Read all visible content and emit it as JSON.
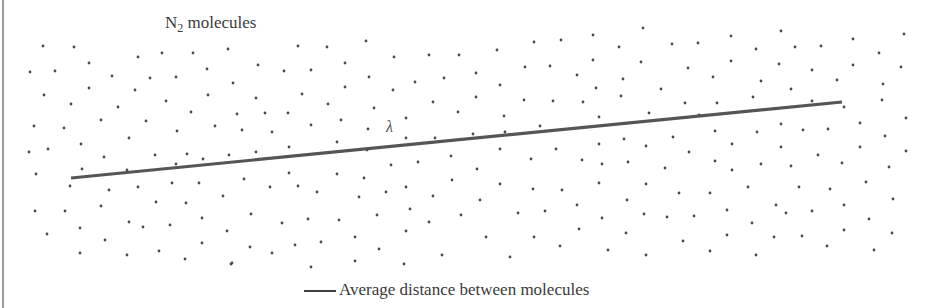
{
  "diagram": {
    "title": {
      "prefix": "N",
      "subscript": "2",
      "suffix": " molecules"
    },
    "path_symbol": "λ",
    "caption": "Average distance between molecules",
    "colors": {
      "dot": "#4a4a4a",
      "path_line": "#555555",
      "text": "#3a3a3a",
      "border": "#9a9a9a",
      "background": "#ffffff"
    },
    "path_line": {
      "x1": 71,
      "y1": 178,
      "x2": 842,
      "y2": 102,
      "stroke_width": 3.2
    },
    "dot_radius": 1.4,
    "molecules": [
      [
        43,
        46
      ],
      [
        74,
        47
      ],
      [
        89,
        63
      ],
      [
        138,
        57
      ],
      [
        162,
        53
      ],
      [
        193,
        53
      ],
      [
        228,
        49
      ],
      [
        30,
        72
      ],
      [
        55,
        71
      ],
      [
        112,
        76
      ],
      [
        150,
        78
      ],
      [
        176,
        77
      ],
      [
        207,
        69
      ],
      [
        233,
        83
      ],
      [
        44,
        95
      ],
      [
        89,
        88
      ],
      [
        135,
        90
      ],
      [
        71,
        104
      ],
      [
        166,
        101
      ],
      [
        208,
        95
      ],
      [
        118,
        107
      ],
      [
        191,
        112
      ],
      [
        237,
        114
      ],
      [
        34,
        126
      ],
      [
        64,
        128
      ],
      [
        101,
        120
      ],
      [
        146,
        121
      ],
      [
        177,
        131
      ],
      [
        215,
        126
      ],
      [
        129,
        138
      ],
      [
        81,
        144
      ],
      [
        48,
        149
      ],
      [
        29,
        152
      ],
      [
        104,
        157
      ],
      [
        155,
        155
      ],
      [
        187,
        154
      ],
      [
        203,
        159
      ],
      [
        229,
        155
      ],
      [
        36,
        174
      ],
      [
        82,
        169
      ],
      [
        127,
        170
      ],
      [
        176,
        164
      ],
      [
        70,
        186
      ],
      [
        109,
        190
      ],
      [
        138,
        187
      ],
      [
        172,
        183
      ],
      [
        199,
        183
      ],
      [
        223,
        196
      ],
      [
        35,
        211
      ],
      [
        65,
        211
      ],
      [
        101,
        206
      ],
      [
        156,
        202
      ],
      [
        186,
        203
      ],
      [
        129,
        222
      ],
      [
        143,
        227
      ],
      [
        170,
        225
      ],
      [
        202,
        218
      ],
      [
        80,
        228
      ],
      [
        227,
        231
      ],
      [
        47,
        234
      ],
      [
        105,
        240
      ],
      [
        202,
        243
      ],
      [
        80,
        253
      ],
      [
        127,
        255
      ],
      [
        159,
        251
      ],
      [
        185,
        259
      ],
      [
        231,
        264
      ],
      [
        298,
        46
      ],
      [
        327,
        47
      ],
      [
        366,
        41
      ],
      [
        258,
        65
      ],
      [
        345,
        63
      ],
      [
        394,
        57
      ],
      [
        429,
        55
      ],
      [
        459,
        55
      ],
      [
        284,
        71
      ],
      [
        311,
        70
      ],
      [
        369,
        77
      ],
      [
        415,
        82
      ],
      [
        444,
        78
      ],
      [
        256,
        98
      ],
      [
        302,
        94
      ],
      [
        345,
        87
      ],
      [
        393,
        90
      ],
      [
        328,
        104
      ],
      [
        374,
        108
      ],
      [
        433,
        102
      ],
      [
        265,
        113
      ],
      [
        288,
        113
      ],
      [
        341,
        120
      ],
      [
        406,
        118
      ],
      [
        458,
        112
      ],
      [
        242,
        130
      ],
      [
        272,
        132
      ],
      [
        311,
        125
      ],
      [
        368,
        129
      ],
      [
        406,
        138
      ],
      [
        435,
        138
      ],
      [
        289,
        147
      ],
      [
        337,
        142
      ],
      [
        256,
        152
      ],
      [
        367,
        150
      ],
      [
        451,
        156
      ],
      [
        391,
        165
      ],
      [
        418,
        162
      ],
      [
        244,
        179
      ],
      [
        289,
        173
      ],
      [
        337,
        174
      ],
      [
        364,
        178
      ],
      [
        452,
        180
      ],
      [
        270,
        187
      ],
      [
        298,
        186
      ],
      [
        317,
        192
      ],
      [
        359,
        197
      ],
      [
        386,
        192
      ],
      [
        406,
        187
      ],
      [
        433,
        196
      ],
      [
        251,
        214
      ],
      [
        282,
        223
      ],
      [
        308,
        219
      ],
      [
        339,
        220
      ],
      [
        377,
        215
      ],
      [
        410,
        209
      ],
      [
        429,
        222
      ],
      [
        461,
        215
      ],
      [
        406,
        231
      ],
      [
        355,
        237
      ],
      [
        250,
        247
      ],
      [
        272,
        253
      ],
      [
        295,
        245
      ],
      [
        321,
        242
      ],
      [
        379,
        249
      ],
      [
        442,
        255
      ],
      [
        232,
        263
      ],
      [
        311,
        267
      ],
      [
        355,
        261
      ],
      [
        404,
        264
      ],
      [
        643,
        28
      ],
      [
        593,
        35
      ],
      [
        497,
        50
      ],
      [
        534,
        42
      ],
      [
        561,
        40
      ],
      [
        619,
        47
      ],
      [
        672,
        44
      ],
      [
        698,
        43
      ],
      [
        476,
        73
      ],
      [
        525,
        67
      ],
      [
        550,
        66
      ],
      [
        593,
        60
      ],
      [
        641,
        62
      ],
      [
        688,
        68
      ],
      [
        577,
        75
      ],
      [
        500,
        85
      ],
      [
        623,
        79
      ],
      [
        476,
        97
      ],
      [
        524,
        100
      ],
      [
        553,
        101
      ],
      [
        583,
        102
      ],
      [
        596,
        88
      ],
      [
        621,
        96
      ],
      [
        661,
        89
      ],
      [
        685,
        103
      ],
      [
        504,
        116
      ],
      [
        599,
        117
      ],
      [
        649,
        113
      ],
      [
        473,
        134
      ],
      [
        505,
        132
      ],
      [
        540,
        126
      ],
      [
        500,
        149
      ],
      [
        556,
        149
      ],
      [
        599,
        144
      ],
      [
        624,
        139
      ],
      [
        646,
        146
      ],
      [
        673,
        137
      ],
      [
        689,
        152
      ],
      [
        531,
        159
      ],
      [
        582,
        160
      ],
      [
        602,
        164
      ],
      [
        628,
        162
      ],
      [
        665,
        168
      ],
      [
        477,
        169
      ],
      [
        500,
        184
      ],
      [
        533,
        189
      ],
      [
        562,
        190
      ],
      [
        599,
        183
      ],
      [
        646,
        184
      ],
      [
        679,
        193
      ],
      [
        480,
        200
      ],
      [
        577,
        205
      ],
      [
        627,
        200
      ],
      [
        518,
        213
      ],
      [
        545,
        211
      ],
      [
        602,
        218
      ],
      [
        644,
        214
      ],
      [
        667,
        217
      ],
      [
        694,
        216
      ],
      [
        486,
        237
      ],
      [
        534,
        237
      ],
      [
        579,
        229
      ],
      [
        626,
        233
      ],
      [
        683,
        241
      ],
      [
        560,
        246
      ],
      [
        608,
        250
      ],
      [
        510,
        257
      ],
      [
        646,
        255
      ],
      [
        731,
        36
      ],
      [
        781,
        31
      ],
      [
        756,
        49
      ],
      [
        795,
        47
      ],
      [
        821,
        46
      ],
      [
        853,
        39
      ],
      [
        879,
        53
      ],
      [
        904,
        34
      ],
      [
        731,
        61
      ],
      [
        779,
        64
      ],
      [
        812,
        70
      ],
      [
        853,
        65
      ],
      [
        901,
        67
      ],
      [
        713,
        77
      ],
      [
        761,
        81
      ],
      [
        791,
        89
      ],
      [
        837,
        80
      ],
      [
        883,
        84
      ],
      [
        717,
        103
      ],
      [
        753,
        97
      ],
      [
        812,
        101
      ],
      [
        882,
        100
      ],
      [
        844,
        107
      ],
      [
        699,
        115
      ],
      [
        906,
        118
      ],
      [
        715,
        131
      ],
      [
        757,
        132
      ],
      [
        781,
        124
      ],
      [
        803,
        130
      ],
      [
        828,
        129
      ],
      [
        860,
        123
      ],
      [
        885,
        136
      ],
      [
        732,
        144
      ],
      [
        781,
        147
      ],
      [
        860,
        147
      ],
      [
        906,
        151
      ],
      [
        818,
        155
      ],
      [
        715,
        161
      ],
      [
        732,
        170
      ],
      [
        761,
        164
      ],
      [
        791,
        166
      ],
      [
        842,
        163
      ],
      [
        889,
        167
      ],
      [
        710,
        193
      ],
      [
        748,
        187
      ],
      [
        799,
        187
      ],
      [
        830,
        189
      ],
      [
        866,
        182
      ],
      [
        893,
        199
      ],
      [
        727,
        210
      ],
      [
        776,
        205
      ],
      [
        786,
        213
      ],
      [
        812,
        211
      ],
      [
        844,
        205
      ],
      [
        869,
        219
      ],
      [
        752,
        223
      ],
      [
        727,
        235
      ],
      [
        774,
        237
      ],
      [
        802,
        236
      ],
      [
        844,
        230
      ],
      [
        892,
        233
      ],
      [
        827,
        246
      ],
      [
        874,
        250
      ],
      [
        710,
        251
      ],
      [
        756,
        255
      ]
    ]
  }
}
